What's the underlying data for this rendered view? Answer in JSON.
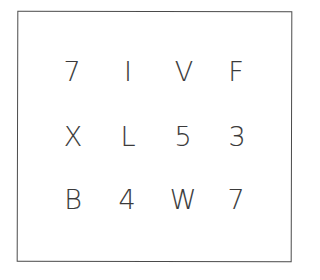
{
  "grid": {
    "rows": [
      [
        "7",
        "I",
        "V",
        "F"
      ],
      [
        "X",
        "L",
        "5",
        "3"
      ],
      [
        "B",
        "4",
        "W",
        "7"
      ]
    ]
  },
  "colors": {
    "ink": "#3a3a3a",
    "border": "#4a4a4a",
    "background": "#ffffff"
  }
}
